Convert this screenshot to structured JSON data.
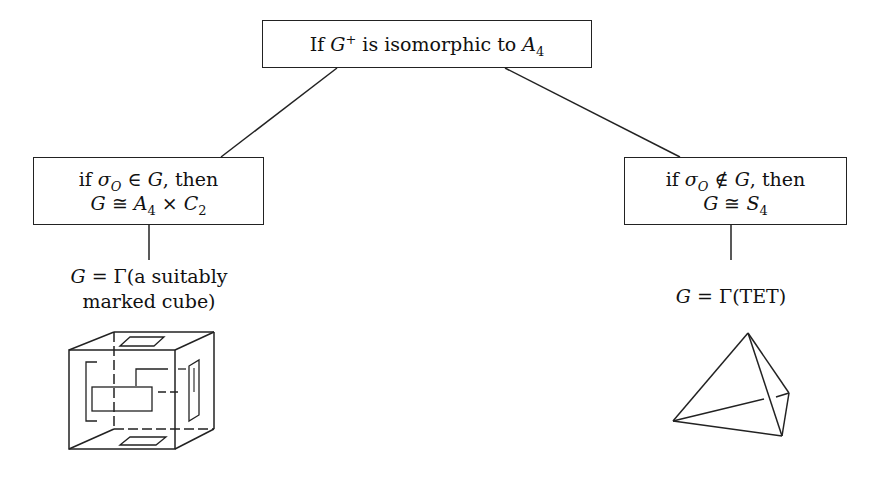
{
  "root": {
    "prefix": "If ",
    "group": "G",
    "group_sup": "+",
    "middle": " is isomorphic to ",
    "target": "A",
    "target_sub": "4"
  },
  "left_branch": {
    "line1_prefix": "if ",
    "sigma": "σ",
    "sigma_sub": "O",
    "relation": " ∈ ",
    "group": "G",
    "line1_suffix": ", then",
    "line2_group": "G",
    "line2_iso": " ≅ ",
    "line2_A": "A",
    "line2_A_sub": "4",
    "line2_times": " × ",
    "line2_C": "C",
    "line2_C_sub": "2",
    "caption_line1_G": "G",
    "caption_line1_rest": " = Γ(a suitably",
    "caption_line2": "marked cube)",
    "figure": "marked-cube"
  },
  "right_branch": {
    "line1_prefix": "if ",
    "sigma": "σ",
    "sigma_sub": "O",
    "relation": " ∉ ",
    "group": "G",
    "line1_suffix": ", then",
    "line2_group": "G",
    "line2_iso": " ≅ ",
    "line2_S": "S",
    "line2_S_sub": "4",
    "caption_G": "G",
    "caption_rest": " = Γ(TET)",
    "figure": "tetrahedron"
  }
}
